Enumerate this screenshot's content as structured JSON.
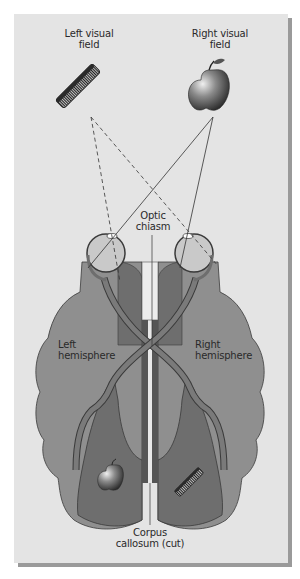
{
  "figure": {
    "labels": {
      "left_visual_field": [
        "Left visual",
        "field"
      ],
      "right_visual_field": [
        "Right visual",
        "field"
      ],
      "optic_chiasm": [
        "Optic",
        "chiasm"
      ],
      "left_hemisphere": [
        "Left",
        "hemisphere"
      ],
      "right_hemisphere": [
        "Right",
        "hemisphere"
      ],
      "corpus_callosum": [
        "Corpus",
        "callosum (cut)"
      ]
    },
    "objects": {
      "left_field_object": "comb",
      "right_field_object": "apple",
      "left_hemisphere_percept": "apple",
      "right_hemisphere_percept": "comb"
    },
    "colors": {
      "panel": "#e4e4e4",
      "panel_shadow": "#9a9a9a",
      "hemisphere_light": "#8f8f8f",
      "hemisphere_dark": "#6e6e6e",
      "optic_tract": "#7a7a7a",
      "eye": "#c9c9c9",
      "line": "#333333"
    }
  }
}
